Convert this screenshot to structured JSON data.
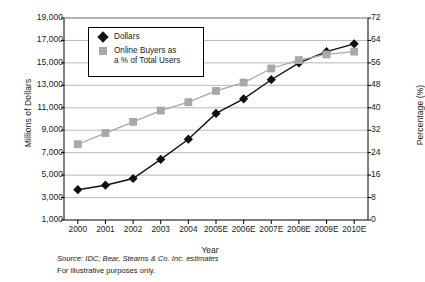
{
  "chart_data": {
    "type": "line",
    "title": "",
    "xlabel": "Year",
    "ylabel": "Millions of Dollars",
    "y2label": "Percentage (%)",
    "grid": true,
    "legend_position": "top-left-inside",
    "categories": [
      "2000",
      "2001",
      "2002",
      "2003",
      "2004",
      "2005E",
      "2006E",
      "2007E",
      "2008E",
      "2009E",
      "2010E"
    ],
    "ylim": [
      1000,
      19000
    ],
    "yticks": [
      "1,000",
      "3,000",
      "5,000",
      "7,000",
      "9,000",
      "11,000",
      "13,000",
      "15,000",
      "17,000",
      "19,000"
    ],
    "y2lim": [
      0,
      72
    ],
    "y2ticks": [
      "0",
      "8",
      "16",
      "24",
      "32",
      "40",
      "48",
      "56",
      "64",
      "72"
    ],
    "series": [
      {
        "name": "Dollars",
        "axis": "left",
        "marker": "diamond",
        "color": "#111111",
        "values": [
          3700,
          4100,
          4700,
          6400,
          8200,
          10500,
          11800,
          13500,
          15000,
          16000,
          16700
        ]
      },
      {
        "name": "Online Buyers as a % of Total Users",
        "axis": "right",
        "marker": "square",
        "color": "#a8a8a8",
        "values": [
          27,
          31,
          35,
          39,
          42,
          46,
          49,
          54,
          57,
          59,
          60
        ]
      }
    ],
    "annotations": [
      "Source: IDC; Bear, Stearns & Co. Inc. estimates",
      "For illustrative purposes only."
    ]
  },
  "legend": {
    "items": [
      {
        "label": "Dollars",
        "line1": "Dollars",
        "line2": ""
      },
      {
        "label": "Online Buyers as a % of Total Users",
        "line1": "Online Buyers as",
        "line2": "a % of Total Users"
      }
    ]
  },
  "footer": {
    "source": "Source: IDC; Bear, Stearns & Co. Inc. estimates",
    "disclaimer": "For illustrative purposes only."
  }
}
